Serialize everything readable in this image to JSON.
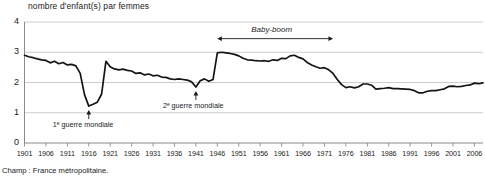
{
  "chart_data": {
    "type": "line",
    "title": "nombre d'enfant(s) par femmes",
    "xlabel": "",
    "ylabel": "nombre d'enfant(s) par femmes",
    "ylim": [
      0,
      4
    ],
    "xlim": [
      1901,
      2008
    ],
    "grid": true,
    "legend_position": "none",
    "y_ticks": [
      "0",
      "1",
      "2",
      "3",
      "4"
    ],
    "y_tick_values": [
      0,
      1,
      2,
      3,
      4
    ],
    "x_ticks": [
      "1901",
      "1906",
      "1911",
      "1916",
      "1921",
      "1926",
      "1931",
      "1936",
      "1941",
      "1946",
      "1951",
      "1956",
      "1961",
      "1966",
      "1971",
      "1976",
      "1981",
      "1986",
      "1991",
      "1996",
      "2001",
      "2006"
    ],
    "x_tick_values": [
      1901,
      1906,
      1911,
      1916,
      1921,
      1926,
      1931,
      1936,
      1941,
      1946,
      1951,
      1956,
      1961,
      1966,
      1971,
      1976,
      1981,
      1986,
      1991,
      1996,
      2001,
      2006
    ],
    "series": [
      {
        "name": "indicateur conjoncturel de fécondité",
        "x": [
          1901,
          1902,
          1903,
          1904,
          1905,
          1906,
          1907,
          1908,
          1909,
          1910,
          1911,
          1912,
          1913,
          1914,
          1915,
          1916,
          1917,
          1918,
          1919,
          1920,
          1921,
          1922,
          1923,
          1924,
          1925,
          1926,
          1927,
          1928,
          1929,
          1930,
          1931,
          1932,
          1933,
          1934,
          1935,
          1936,
          1937,
          1938,
          1939,
          1940,
          1941,
          1942,
          1943,
          1944,
          1945,
          1946,
          1947,
          1948,
          1949,
          1950,
          1951,
          1952,
          1953,
          1954,
          1955,
          1956,
          1957,
          1958,
          1959,
          1960,
          1961,
          1962,
          1963,
          1964,
          1965,
          1966,
          1967,
          1968,
          1969,
          1970,
          1971,
          1972,
          1973,
          1974,
          1975,
          1976,
          1977,
          1978,
          1979,
          1980,
          1981,
          1982,
          1983,
          1984,
          1985,
          1986,
          1987,
          1988,
          1989,
          1990,
          1991,
          1992,
          1993,
          1994,
          1995,
          1996,
          1997,
          1998,
          1999,
          2000,
          2001,
          2002,
          2003,
          2004,
          2005,
          2006,
          2007,
          2008
        ],
        "values": [
          2.9,
          2.85,
          2.82,
          2.78,
          2.75,
          2.73,
          2.65,
          2.7,
          2.62,
          2.66,
          2.58,
          2.6,
          2.55,
          2.3,
          1.6,
          1.22,
          1.28,
          1.35,
          1.62,
          2.7,
          2.52,
          2.45,
          2.42,
          2.44,
          2.4,
          2.38,
          2.3,
          2.32,
          2.25,
          2.28,
          2.22,
          2.24,
          2.18,
          2.17,
          2.12,
          2.1,
          2.12,
          2.1,
          2.08,
          2.02,
          1.85,
          2.06,
          2.12,
          2.04,
          2.1,
          2.98,
          3.0,
          2.98,
          2.96,
          2.93,
          2.88,
          2.8,
          2.75,
          2.74,
          2.72,
          2.71,
          2.72,
          2.7,
          2.75,
          2.73,
          2.8,
          2.79,
          2.88,
          2.9,
          2.83,
          2.78,
          2.66,
          2.58,
          2.52,
          2.47,
          2.49,
          2.42,
          2.3,
          2.1,
          1.93,
          1.83,
          1.86,
          1.82,
          1.86,
          1.95,
          1.95,
          1.91,
          1.78,
          1.8,
          1.81,
          1.83,
          1.8,
          1.8,
          1.79,
          1.78,
          1.77,
          1.73,
          1.66,
          1.66,
          1.71,
          1.73,
          1.73,
          1.76,
          1.79,
          1.87,
          1.88,
          1.86,
          1.87,
          1.9,
          1.92,
          1.98,
          1.96,
          1.99
        ]
      }
    ],
    "annotations": [
      {
        "id": "ww1",
        "label": "1ᵉ guerre  mondiale",
        "x_year": 1916,
        "y_value": 1.22
      },
      {
        "id": "ww2",
        "label": "2ᵉ guerre mondiale",
        "x_year": 1941,
        "y_value": 1.85
      },
      {
        "id": "babyboom",
        "label": "Baby-boom",
        "x_start": 1946,
        "x_end": 1973,
        "y_value": 3.45
      }
    ]
  },
  "footer": {
    "note": "Champ : France métropolitaine."
  },
  "colors": {
    "line": "#141414",
    "grid": "#bfbfbf",
    "axis": "#808080",
    "text": "#1a1a1a",
    "background": "#ffffff"
  }
}
